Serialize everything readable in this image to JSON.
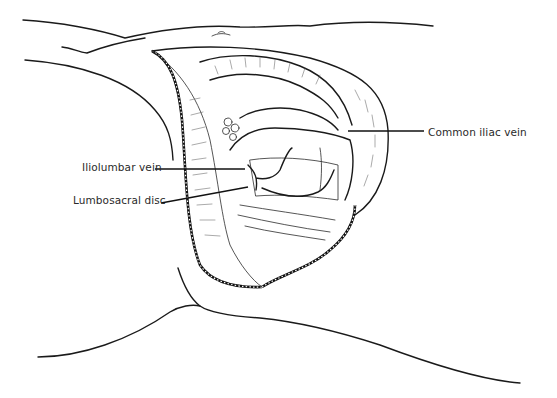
{
  "figure": {
    "labels": {
      "common_iliac_vein": "Common iliac vein",
      "iliolumbar_vein": "Iliolumbar vein",
      "lumbosacral_disc": "Lumbosacral disc"
    },
    "colors": {
      "line": "#1a1a1a",
      "background": "#ffffff",
      "label_text": "#2a2a2a"
    }
  }
}
